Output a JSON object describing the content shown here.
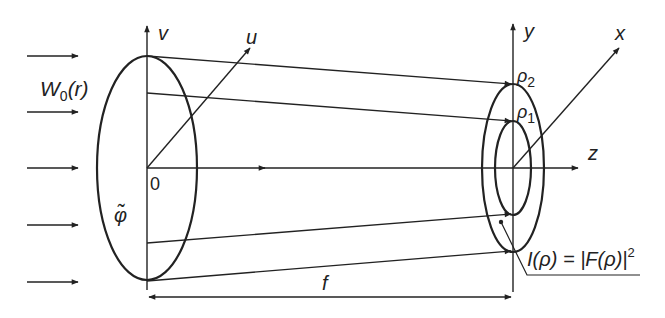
{
  "figure": {
    "type": "optical-focusing-diagram",
    "incident_beam_label_main": "W",
    "incident_beam_label_sub": "0",
    "incident_beam_label_arg": "(r)",
    "incident_arrow_count": 5,
    "input_plane": {
      "axis_vertical": "v",
      "axis_oblique": "u",
      "origin_label": "0",
      "phase_label": "φ̃"
    },
    "output_plane": {
      "axis_vertical": "y",
      "axis_oblique": "x",
      "outer_radius_label_main": "ρ",
      "outer_radius_label_sub": "2",
      "inner_radius_label_main": "ρ",
      "inner_radius_label_sub": "1",
      "intensity_label": "I(ρ) = |F(ρ)|",
      "intensity_label_exp": "2"
    },
    "optical_axis_label": "z",
    "focal_distance_label": "f"
  },
  "colors": {
    "stroke": "#222222",
    "background": "#ffffff"
  }
}
